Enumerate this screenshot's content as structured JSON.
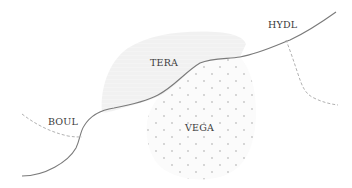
{
  "map": {
    "colors": {
      "background": "#ffffff",
      "region_fill": "#f1f1f1",
      "dot_color": "#c4c4c4",
      "main_line": "#7a7a7a",
      "dashed_line": "#a8a8a8",
      "label_text": "#3a3a3a"
    },
    "regions": [
      {
        "id": "tera",
        "label": "TERA",
        "style": "shaded"
      },
      {
        "id": "vega",
        "label": "VEGA",
        "style": "dotted"
      }
    ],
    "labels": {
      "tera": "TERA",
      "hydl": "HYDL",
      "boul": "BOUL",
      "vega": "VEGA"
    },
    "lines": [
      {
        "id": "main-boundary",
        "style": "solid"
      },
      {
        "id": "boul-boundary",
        "style": "dashed"
      },
      {
        "id": "hydl-boundary",
        "style": "dashed"
      }
    ]
  }
}
